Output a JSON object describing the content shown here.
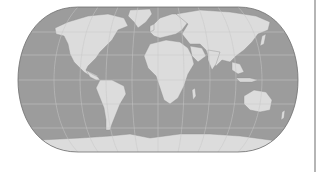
{
  "map": {
    "projection": "eckert-iv-like",
    "colors": {
      "background": "#ffffff",
      "ocean": "#9c9c9c",
      "land": "#dcdcdc",
      "land_stroke": "#8a8a8a",
      "graticule": "#c8c8c8",
      "outline": "#6e6e6e",
      "edge_line": "#b5b5b5"
    },
    "graticule": {
      "meridian_step_deg": 30,
      "parallel_step_deg": 30
    },
    "continents": [
      "North America",
      "South America",
      "Europe",
      "Africa",
      "Asia",
      "Australia",
      "Antarctica",
      "Greenland"
    ]
  }
}
